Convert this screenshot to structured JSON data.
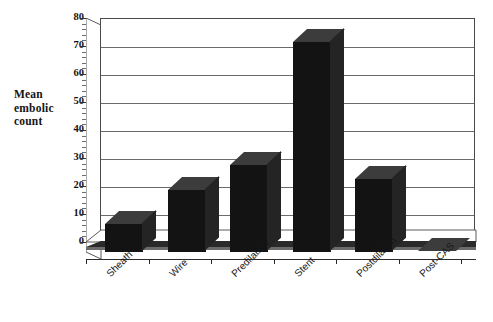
{
  "chart_data": {
    "type": "bar",
    "title": "",
    "xlabel": "",
    "ylabel": "Mean embolic count",
    "categories": [
      "Sheath",
      "Wire",
      "Predilation",
      "Stent",
      "Postdilation",
      "Post-CAS"
    ],
    "values": [
      10,
      22,
      31,
      75,
      26,
      0
    ],
    "ylim": [
      0,
      80
    ],
    "ytick_labels": [
      "0",
      "10",
      "20",
      "30",
      "40",
      "50",
      "60",
      "70",
      "80"
    ],
    "ytick_values": [
      0,
      10,
      20,
      30,
      40,
      50,
      60,
      70,
      80
    ],
    "ytick_step": 10,
    "minor_ticks_per_interval": 4,
    "grid": true,
    "grid_orientation": "horizontal",
    "legend": "none",
    "three_d": true,
    "bar_color": "#131313",
    "bar_top_color": "#3c3c3c",
    "bar_side_color": "#242424",
    "plot_background": "#ffffff",
    "gridline_color": "#6a6a6a",
    "axis_color": "#3a3a3a",
    "xlabel_rotation_degrees": -45,
    "series": [
      {
        "name": "Mean embolic count",
        "values": [
          10,
          22,
          31,
          75,
          26,
          0
        ]
      }
    ],
    "annotations": []
  },
  "ylabel_lines": [
    "Mean",
    "embolic",
    "count"
  ],
  "caption": {
    "text": "",
    "visible_fragment": ""
  }
}
